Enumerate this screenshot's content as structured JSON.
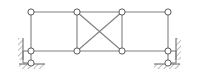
{
  "diagram": {
    "type": "structural-frame-diagram",
    "canvas": {
      "width": 198,
      "height": 73
    },
    "colors": {
      "background": "#ffffff",
      "member": "#808080",
      "member_dark": "#6e6e6e",
      "node_fill": "#ffffff",
      "node_stroke": "#5a5a5a",
      "hatch": "#9a9a9a",
      "support_line": "#6e6e6e"
    },
    "geometry": {
      "member_width": 1.1,
      "node_radius": 3.1,
      "node_stroke_width": 1.0,
      "top_chord_y": 12,
      "bottom_chord_y": 51,
      "columns_x": [
        31,
        77,
        122,
        168
      ],
      "left_ground_node": {
        "x": 31,
        "y": 63
      },
      "right_ground_node": {
        "x": 168,
        "y": 63
      }
    },
    "nodes": [
      {
        "id": "T1",
        "label": "top-left-node",
        "x": 31,
        "y": 12
      },
      {
        "id": "T2",
        "label": "top-mid-left-node",
        "x": 77,
        "y": 12
      },
      {
        "id": "T3",
        "label": "top-mid-right-node",
        "x": 122,
        "y": 12
      },
      {
        "id": "T4",
        "label": "top-right-node",
        "x": 168,
        "y": 12
      },
      {
        "id": "B1",
        "label": "bottom-left-node",
        "x": 31,
        "y": 51
      },
      {
        "id": "B2",
        "label": "bottom-mid-left-node",
        "x": 77,
        "y": 51
      },
      {
        "id": "B3",
        "label": "bottom-mid-right-node",
        "x": 122,
        "y": 51
      },
      {
        "id": "B4",
        "label": "bottom-right-node",
        "x": 168,
        "y": 51
      },
      {
        "id": "S1",
        "label": "left-roller-node",
        "x": 31,
        "y": 63
      },
      {
        "id": "S2",
        "label": "right-roller-node",
        "x": 168,
        "y": 63
      }
    ],
    "members": [
      {
        "id": "M1",
        "label": "top-chord-left-bay",
        "from": "T1",
        "to": "T2"
      },
      {
        "id": "M2",
        "label": "top-chord-middle-bay",
        "from": "T2",
        "to": "T3"
      },
      {
        "id": "M3",
        "label": "top-chord-right-bay",
        "from": "T3",
        "to": "T4"
      },
      {
        "id": "M4",
        "label": "bottom-chord-left-bay",
        "from": "B1",
        "to": "B2"
      },
      {
        "id": "M5",
        "label": "bottom-chord-middle-bay",
        "from": "B2",
        "to": "B3"
      },
      {
        "id": "M6",
        "label": "bottom-chord-right-bay",
        "from": "B3",
        "to": "B4"
      },
      {
        "id": "M7",
        "label": "left-column",
        "from": "T1",
        "to": "B1"
      },
      {
        "id": "M8",
        "label": "second-column",
        "from": "T2",
        "to": "B2"
      },
      {
        "id": "M9",
        "label": "third-column",
        "from": "T3",
        "to": "B3"
      },
      {
        "id": "M10",
        "label": "right-column",
        "from": "T4",
        "to": "B4"
      },
      {
        "id": "M11",
        "label": "diagonal-brace-down-right",
        "from": "T2",
        "to": "B3"
      },
      {
        "id": "M12",
        "label": "diagonal-brace-down-left",
        "from": "T3",
        "to": "B2"
      },
      {
        "id": "M13",
        "label": "left-support-stub",
        "from": "B1",
        "to": "S1"
      },
      {
        "id": "M14",
        "label": "right-support-stub",
        "from": "B4",
        "to": "S2"
      }
    ],
    "supports": {
      "left": {
        "label": "left-support",
        "wall": {
          "x": 18,
          "y": 38,
          "width": 5,
          "height": 22,
          "orientation": "vertical"
        },
        "wall_line": {
          "x1": 23,
          "y1": 38,
          "x2": 23,
          "y2": 60
        },
        "ground": {
          "x": 19,
          "y": 64,
          "width": 26,
          "height": 5,
          "orientation": "horizontal"
        },
        "ground_line": {
          "x1": 19,
          "y1": 64,
          "x2": 45,
          "y2": 64
        },
        "bracket": {
          "x1": 23,
          "y1": 51,
          "x2": 31,
          "y2": 51
        }
      },
      "right": {
        "label": "right-support",
        "wall": {
          "x": 176,
          "y": 38,
          "width": 5,
          "height": 22,
          "orientation": "vertical"
        },
        "wall_line": {
          "x1": 176,
          "y1": 38,
          "x2": 176,
          "y2": 60
        },
        "ground": {
          "x": 154,
          "y": 64,
          "width": 26,
          "height": 5,
          "orientation": "horizontal"
        },
        "ground_line": {
          "x1": 154,
          "y1": 64,
          "x2": 180,
          "y2": 64
        },
        "bracket": {
          "x1": 168,
          "y1": 51,
          "x2": 176,
          "y2": 51
        }
      }
    }
  }
}
